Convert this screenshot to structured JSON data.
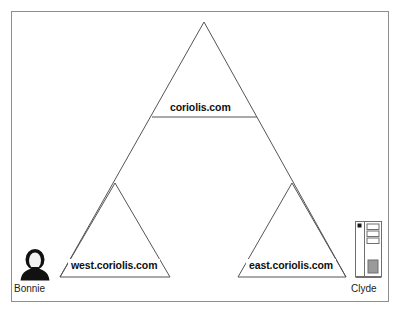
{
  "diagram": {
    "frame": {
      "border_color": "#8e8e8e",
      "background": "#ffffff"
    },
    "line_color": "#555555",
    "zones": [
      {
        "id": "root",
        "label": "coriolis.com",
        "name": "root-zone-triangle",
        "apex": [
          204,
          22
        ],
        "base_left": [
          60,
          277
        ],
        "base_right": [
          345,
          277
        ],
        "cut_line_y": 117
      },
      {
        "id": "west",
        "label": "west.coriolis.com",
        "name": "west-zone-triangle",
        "apex": [
          115,
          183
        ],
        "base_left": [
          60,
          277
        ],
        "base_right": [
          170,
          277
        ]
      },
      {
        "id": "east",
        "label": "east.coriolis.com",
        "name": "east-zone-triangle",
        "apex": [
          292,
          183
        ],
        "base_left": [
          238,
          277
        ],
        "base_right": [
          346,
          277
        ]
      }
    ],
    "hosts": [
      {
        "id": "bonnie",
        "label": "Bonnie",
        "icon": "person-icon",
        "icon_color": "#111111"
      },
      {
        "id": "clyde",
        "label": "Clyde",
        "icon": "server-tower-icon",
        "icon_color": "#6f6f6f"
      }
    ]
  }
}
